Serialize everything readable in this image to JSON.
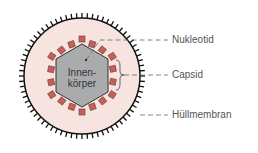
{
  "diagram": {
    "core_label_line1": "Innen-",
    "core_label_line2": "körper",
    "labels": [
      {
        "text": "Nukleotid"
      },
      {
        "text": "Capsid"
      },
      {
        "text": "Hüllmembran"
      }
    ],
    "colors": {
      "membrane_fill": "#f7e3df",
      "membrane_stroke": "#111111",
      "capsomer_fill": "#c0615c",
      "core_fill": "#a9abad",
      "leader_line": "#666666"
    }
  }
}
